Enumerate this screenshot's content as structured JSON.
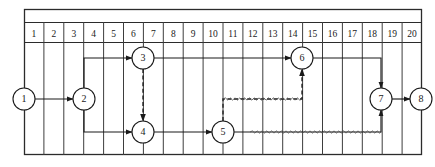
{
  "frame": {
    "x": 24,
    "y": 9,
    "width": 398,
    "height": 146,
    "header_row_y": 22,
    "header_row_height": 20,
    "border_color": "#2b2b2b",
    "grid_color": "#3a3a3a"
  },
  "timescale": {
    "label": "time units",
    "ticks": [
      "1",
      "2",
      "3",
      "4",
      "5",
      "6",
      "7",
      "8",
      "9",
      "10",
      "11",
      "12",
      "13",
      "14",
      "15",
      "16",
      "17",
      "18",
      "19",
      "20"
    ],
    "start": 1,
    "end": 20,
    "column_width": 19.9
  },
  "rows": {
    "top_y": 58,
    "middle_y": 99,
    "bottom_y": 132
  },
  "nodes": [
    {
      "id": "1",
      "label": "1",
      "x": 24,
      "y": 99,
      "r": 11,
      "time": 0,
      "row": "middle"
    },
    {
      "id": "2",
      "label": "2",
      "x": 84,
      "y": 99,
      "r": 11,
      "time": 3,
      "row": "middle"
    },
    {
      "id": "3",
      "label": "3",
      "x": 143,
      "y": 58,
      "r": 11,
      "time": 6,
      "row": "top"
    },
    {
      "id": "4",
      "label": "4",
      "x": 143,
      "y": 132,
      "r": 11,
      "time": 6,
      "row": "bottom"
    },
    {
      "id": "5",
      "label": "5",
      "x": 223,
      "y": 132,
      "r": 11,
      "time": 10,
      "row": "bottom"
    },
    {
      "id": "6",
      "label": "6",
      "x": 302,
      "y": 58,
      "r": 11,
      "time": 14,
      "row": "top"
    },
    {
      "id": "7",
      "label": "7",
      "x": 381,
      "y": 99,
      "r": 11,
      "time": 18,
      "row": "middle"
    },
    {
      "id": "8",
      "label": "8",
      "x": 421,
      "y": 99,
      "r": 11,
      "time": 20,
      "row": "middle"
    }
  ],
  "activities": [
    {
      "name": "a-1-2",
      "from": "1",
      "to": "2",
      "style": "solid",
      "arrow": true,
      "path": "h",
      "x1": 35,
      "y1": 99,
      "x2": 73,
      "y2": 99
    },
    {
      "name": "a-2-3",
      "from": "2",
      "to": "3",
      "style": "solid",
      "arrow": true,
      "path": "up-then-right",
      "x1": 84,
      "y1": 99,
      "x2": 132,
      "y2": 58
    },
    {
      "name": "a-2-4",
      "from": "2",
      "to": "4",
      "style": "solid",
      "arrow": true,
      "path": "down-then-right",
      "x1": 84,
      "y1": 99,
      "x2": 132,
      "y2": 132
    },
    {
      "name": "a-3-4-dummy",
      "from": "3",
      "to": "4",
      "style": "dashed",
      "arrow": true,
      "path": "v",
      "x1": 143,
      "y1": 69,
      "x2": 143,
      "y2": 121
    },
    {
      "name": "a-3-6",
      "from": "3",
      "to": "6",
      "style": "solid",
      "arrow": true,
      "path": "h",
      "x1": 154,
      "y1": 58,
      "x2": 291,
      "y2": 58
    },
    {
      "name": "a-4-5",
      "from": "4",
      "to": "5",
      "style": "solid",
      "arrow": true,
      "path": "h",
      "x1": 154,
      "y1": 132,
      "x2": 212,
      "y2": 132
    },
    {
      "name": "a-5-6-dummy",
      "from": "5",
      "to": "6",
      "style": "dashed",
      "arrow": true,
      "path": "up-float-up",
      "x1": 223,
      "y1": 121,
      "x2": 302,
      "y2": 69
    },
    {
      "name": "a-6-7",
      "from": "6",
      "to": "7",
      "style": "solid",
      "arrow": true,
      "path": "right-then-down",
      "x1": 313,
      "y1": 58,
      "x2": 381,
      "y2": 88
    },
    {
      "name": "a-5-7",
      "from": "5",
      "to": "7",
      "style": "solid",
      "arrow": true,
      "path": "right-then-up",
      "x1": 234,
      "y1": 132,
      "x2": 381,
      "y2": 110
    },
    {
      "name": "a-7-8",
      "from": "7",
      "to": "8",
      "style": "solid",
      "arrow": true,
      "path": "h",
      "x1": 392,
      "y1": 99,
      "x2": 410,
      "y2": 99
    }
  ],
  "float_lines": [
    {
      "name": "float-5-6",
      "style": "wavy",
      "x1": 223,
      "x2": 302,
      "y": 99,
      "meaning": "free float on path 5 to 6"
    },
    {
      "name": "float-5-7",
      "style": "wavy",
      "x1": 250,
      "x2": 381,
      "y": 132,
      "meaning": "free float on path 5 to 7"
    }
  ],
  "colors": {
    "ink": "#1a1a1a",
    "grid": "#3d3d3d",
    "border": "#2b2b2b",
    "node_fill": "#ffffff",
    "float": "#555555",
    "background": "#ffffff"
  },
  "legend": {
    "solid": "activity (scaled to duration)",
    "dashed": "dummy activity",
    "wavy": "float / slack"
  }
}
